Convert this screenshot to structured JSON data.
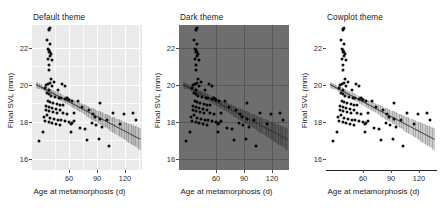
{
  "figure": {
    "width": 441,
    "height": 208,
    "background": "#ffffff"
  },
  "chart_data": {
    "type": "scatter",
    "title": "",
    "xlabel": "Age at metamorphosis (d)",
    "ylabel": "Final SVL (mm)",
    "xlim": [
      30,
      150
    ],
    "ylim": [
      15.4,
      23.6
    ],
    "xticks": [
      60,
      90,
      120
    ],
    "yticks": [
      16,
      18,
      20,
      22
    ],
    "xticklabels": [
      "60",
      "90",
      "120"
    ],
    "yticklabels": [
      "16",
      "18",
      "20",
      "22"
    ],
    "legend": "none",
    "grid": "panel-dependent",
    "panels": [
      {
        "name": "default-theme",
        "title": "Default theme",
        "panel_background": "#ebebeb",
        "gridline_color": "#ffffff",
        "grid": true,
        "axis_line": false
      },
      {
        "name": "dark-theme",
        "title": "Dark theme",
        "panel_background": "#6e6e6e",
        "gridline_color": "#585858",
        "grid": true,
        "axis_line": false
      },
      {
        "name": "cowplot-theme",
        "title": "Cowplot theme",
        "panel_background": "#ffffff",
        "gridline_color": "none",
        "grid": false,
        "axis_line": true
      }
    ],
    "point_color": "#111111",
    "line_color": "#3d3d3d",
    "ribbon_color": "rgba(60,60,60,0.26)",
    "fit": {
      "x_start": 34,
      "y_start": 20.25,
      "x_end": 148,
      "y_end": 17.15,
      "slope": -0.0272,
      "intercept": 21.17,
      "ci_halfwidth_start": 0.16,
      "ci_halfwidth_end": 0.62
    },
    "points": [
      [
        48,
        23.35
      ],
      [
        49,
        23.3
      ],
      [
        50,
        23.45
      ],
      [
        46,
        22.75
      ],
      [
        50,
        22.55
      ],
      [
        47,
        22.25
      ],
      [
        49,
        22.2
      ],
      [
        50,
        22.1
      ],
      [
        48,
        22.05
      ],
      [
        51,
        21.95
      ],
      [
        50,
        21.85
      ],
      [
        47,
        21.7
      ],
      [
        52,
        21.6
      ],
      [
        49,
        21.35
      ],
      [
        48,
        21.05
      ],
      [
        51,
        20.55
      ],
      [
        45,
        20.2
      ],
      [
        47,
        20.25
      ],
      [
        50,
        20.3
      ],
      [
        52,
        20.15
      ],
      [
        44,
        20.05
      ],
      [
        49,
        19.95
      ],
      [
        54,
        20.35
      ],
      [
        58,
        19.95
      ],
      [
        63,
        20.25
      ],
      [
        66,
        20.15
      ],
      [
        46,
        19.75
      ],
      [
        48,
        19.7
      ],
      [
        51,
        19.6
      ],
      [
        55,
        19.55
      ],
      [
        59,
        19.5
      ],
      [
        62,
        19.45
      ],
      [
        66,
        19.4
      ],
      [
        70,
        19.35
      ],
      [
        74,
        19.3
      ],
      [
        47,
        19.3
      ],
      [
        50,
        19.25
      ],
      [
        53,
        19.2
      ],
      [
        57,
        19.15
      ],
      [
        61,
        19.1
      ],
      [
        64,
        19.05
      ],
      [
        45,
        19.0
      ],
      [
        49,
        18.95
      ],
      [
        52,
        18.9
      ],
      [
        56,
        18.85
      ],
      [
        60,
        18.8
      ],
      [
        68,
        19.45
      ],
      [
        69,
        19.4
      ],
      [
        80,
        19.3
      ],
      [
        85,
        18.95
      ],
      [
        92,
        18.8
      ],
      [
        97,
        18.55
      ],
      [
        99,
        18.4
      ],
      [
        104,
        18.3
      ],
      [
        112,
        18.25
      ],
      [
        104,
        19.2
      ],
      [
        118,
        18.65
      ],
      [
        130,
        18.55
      ],
      [
        140,
        18.6
      ],
      [
        143,
        18.2
      ],
      [
        126,
        18.0
      ],
      [
        46,
        18.5
      ],
      [
        43,
        18.4
      ],
      [
        50,
        18.35
      ],
      [
        54,
        18.3
      ],
      [
        58,
        18.25
      ],
      [
        62,
        18.2
      ],
      [
        66,
        18.15
      ],
      [
        70,
        18.1
      ],
      [
        44,
        18.15
      ],
      [
        48,
        18.1
      ],
      [
        52,
        18.05
      ],
      [
        56,
        18.0
      ],
      [
        60,
        17.95
      ],
      [
        72,
        18.0
      ],
      [
        74,
        18.05
      ],
      [
        76,
        18.15
      ],
      [
        82,
        17.8
      ],
      [
        88,
        17.7
      ],
      [
        95,
        18.05
      ],
      [
        100,
        17.95
      ],
      [
        106,
        17.85
      ],
      [
        42,
        17.55
      ],
      [
        38,
        17.05
      ],
      [
        72,
        17.55
      ],
      [
        90,
        17.1
      ],
      [
        103,
        17.15
      ],
      [
        114,
        16.75
      ],
      [
        76,
        18.6
      ],
      [
        68,
        18.55
      ],
      [
        64,
        18.6
      ],
      [
        57,
        18.65
      ],
      [
        53,
        18.7
      ],
      [
        49,
        18.75
      ],
      [
        45,
        18.8
      ]
    ]
  }
}
